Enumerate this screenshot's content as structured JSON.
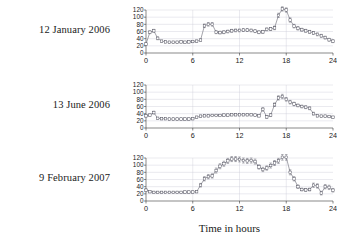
{
  "figure": {
    "xlabel": "Time in hours",
    "panel_labels": [
      "12 January 2006",
      "13 June 2006",
      "9 February 2007"
    ]
  },
  "chart_data": [
    {
      "type": "line",
      "title": "12 January 2006",
      "xlabel": "Time in hours",
      "ylabel": "",
      "xlim": [
        0,
        24
      ],
      "ylim": [
        0,
        120
      ],
      "xticks": [
        0,
        6,
        12,
        18,
        24
      ],
      "yticks": [
        0,
        20,
        40,
        60,
        80,
        100,
        120
      ],
      "grid": true,
      "legend": "none",
      "marker": "open-square",
      "error_bars": true,
      "x": [
        0.0,
        0.5,
        1.0,
        1.5,
        2.0,
        2.5,
        3.0,
        3.5,
        4.0,
        4.5,
        5.0,
        5.5,
        6.0,
        6.5,
        7.0,
        7.5,
        8.0,
        8.5,
        9.0,
        9.5,
        10.0,
        10.5,
        11.0,
        11.5,
        12.0,
        12.5,
        13.0,
        13.5,
        14.0,
        14.5,
        15.0,
        15.5,
        16.0,
        16.5,
        17.0,
        17.5,
        18.0,
        18.5,
        19.0,
        19.5,
        20.0,
        20.5,
        21.0,
        21.5,
        22.0,
        22.5,
        23.0,
        23.5,
        24.0
      ],
      "y": [
        25,
        58,
        62,
        41,
        33,
        31,
        30,
        30,
        30,
        31,
        30,
        31,
        32,
        33,
        36,
        76,
        80,
        80,
        58,
        57,
        58,
        60,
        62,
        63,
        63,
        64,
        64,
        63,
        61,
        58,
        59,
        66,
        67,
        70,
        105,
        123,
        120,
        92,
        75,
        69,
        65,
        62,
        59,
        56,
        52,
        48,
        43,
        37,
        33
      ],
      "yerr": [
        3,
        4,
        4,
        4,
        3,
        3,
        3,
        3,
        3,
        3,
        3,
        3,
        3,
        3,
        3,
        5,
        5,
        5,
        4,
        4,
        4,
        4,
        4,
        4,
        4,
        4,
        4,
        4,
        4,
        4,
        4,
        4,
        4,
        5,
        6,
        6,
        6,
        6,
        5,
        5,
        4,
        4,
        4,
        4,
        4,
        4,
        4,
        4,
        4
      ]
    },
    {
      "type": "line",
      "title": "13 June 2006",
      "xlabel": "Time in hours",
      "ylabel": "",
      "xlim": [
        0,
        24
      ],
      "ylim": [
        0,
        120
      ],
      "xticks": [
        0,
        6,
        12,
        18,
        24
      ],
      "yticks": [
        0,
        20,
        40,
        60,
        80,
        100,
        120
      ],
      "grid": true,
      "legend": "none",
      "marker": "open-square",
      "error_bars": true,
      "x": [
        0.0,
        0.5,
        1.0,
        1.5,
        2.0,
        2.5,
        3.0,
        3.5,
        4.0,
        4.5,
        5.0,
        5.5,
        6.0,
        6.5,
        7.0,
        7.5,
        8.0,
        8.5,
        9.0,
        9.5,
        10.0,
        10.5,
        11.0,
        11.5,
        12.0,
        12.5,
        13.0,
        13.5,
        14.0,
        14.5,
        15.0,
        15.5,
        16.0,
        16.5,
        17.0,
        17.5,
        18.0,
        18.5,
        19.0,
        19.5,
        20.0,
        20.5,
        21.0,
        21.5,
        22.0,
        22.5,
        23.0,
        23.5,
        24.0
      ],
      "y": [
        34,
        36,
        43,
        27,
        26,
        26,
        25,
        25,
        25,
        25,
        25,
        25,
        26,
        30,
        33,
        34,
        34,
        35,
        35,
        35,
        36,
        36,
        37,
        37,
        37,
        37,
        37,
        37,
        36,
        34,
        52,
        31,
        36,
        65,
        84,
        88,
        80,
        72,
        67,
        63,
        60,
        58,
        55,
        40,
        34,
        33,
        33,
        32,
        30
      ],
      "yerr": [
        3,
        3,
        4,
        3,
        3,
        3,
        3,
        3,
        3,
        3,
        3,
        3,
        3,
        3,
        3,
        3,
        3,
        3,
        3,
        3,
        3,
        3,
        3,
        3,
        3,
        3,
        3,
        3,
        3,
        3,
        5,
        4,
        4,
        5,
        6,
        6,
        5,
        5,
        5,
        4,
        4,
        4,
        4,
        4,
        3,
        3,
        3,
        3,
        3
      ]
    },
    {
      "type": "line",
      "title": "9 February 2007",
      "xlabel": "Time in hours",
      "ylabel": "",
      "xlim": [
        0,
        24
      ],
      "ylim": [
        0,
        120
      ],
      "xticks": [
        0,
        6,
        12,
        18,
        24
      ],
      "yticks": [
        0,
        20,
        40,
        60,
        80,
        100,
        120
      ],
      "grid": true,
      "legend": "none",
      "marker": "open-square",
      "error_bars": true,
      "x": [
        0.0,
        0.5,
        1.0,
        1.5,
        2.0,
        2.5,
        3.0,
        3.5,
        4.0,
        4.5,
        5.0,
        5.5,
        6.0,
        6.5,
        7.0,
        7.5,
        8.0,
        8.5,
        9.0,
        9.5,
        10.0,
        10.5,
        11.0,
        11.5,
        12.0,
        12.5,
        13.0,
        13.5,
        14.0,
        14.5,
        15.0,
        15.5,
        16.0,
        16.5,
        17.0,
        17.5,
        18.0,
        18.5,
        19.0,
        19.5,
        20.0,
        20.5,
        21.0,
        21.5,
        22.0,
        22.5,
        23.0,
        23.5,
        24.0
      ],
      "y": [
        30,
        26,
        24,
        24,
        24,
        24,
        24,
        24,
        24,
        24,
        25,
        25,
        25,
        26,
        44,
        62,
        68,
        70,
        85,
        97,
        104,
        112,
        117,
        117,
        116,
        113,
        112,
        113,
        110,
        95,
        88,
        92,
        99,
        106,
        112,
        122,
        122,
        80,
        62,
        40,
        32,
        31,
        32,
        44,
        42,
        22,
        40,
        38,
        30
      ],
      "yerr": [
        4,
        3,
        3,
        3,
        3,
        3,
        3,
        3,
        3,
        3,
        3,
        3,
        3,
        3,
        5,
        6,
        6,
        6,
        7,
        7,
        7,
        7,
        7,
        7,
        7,
        7,
        7,
        7,
        7,
        6,
        6,
        6,
        7,
        7,
        7,
        8,
        8,
        7,
        6,
        5,
        4,
        4,
        4,
        6,
        6,
        5,
        6,
        6,
        5
      ]
    }
  ]
}
